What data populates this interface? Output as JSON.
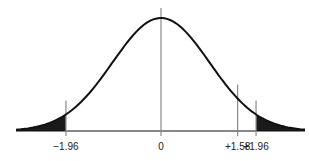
{
  "chart_data": {
    "type": "area",
    "title": "",
    "xlabel": "",
    "ylabel": "",
    "x_tick_labels": [
      "−1.96",
      "0",
      "+1.58",
      "+1.96"
    ],
    "x_tick_values": [
      -1.96,
      0,
      1.58,
      1.96
    ],
    "shaded_regions": [
      {
        "from": -3.0,
        "to": -1.96,
        "label": "left tail"
      },
      {
        "from": 1.96,
        "to": 3.0,
        "label": "right tail"
      }
    ],
    "marker_lines": [
      -1.96,
      0,
      1.58,
      1.96
    ],
    "xlim": [
      -3.0,
      3.0
    ],
    "grid": false,
    "colors": {
      "curve": "#111111",
      "shade": "#1a1a1a",
      "marker": "#8a8a8a"
    }
  }
}
